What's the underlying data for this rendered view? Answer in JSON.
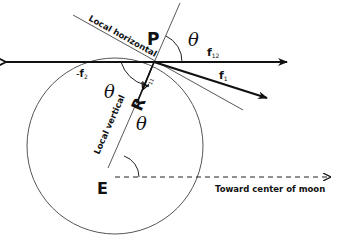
{
  "diagram": {
    "points": {
      "P": "P",
      "E": "E",
      "R": "R"
    },
    "angle_symbol": "θ",
    "lines": {
      "local_horizontal": "Local horizontal",
      "local_vertical": "Local vertical",
      "toward_moon": "Toward center of moon"
    },
    "forces": {
      "f12_base": "f",
      "f12_sub": "12",
      "f1_base": "f",
      "f1_sub": "1",
      "f11_base": "f",
      "f11_sub": "11",
      "neg_f2_prefix": "-",
      "neg_f2_base": "f",
      "neg_f2_sub": "2"
    },
    "colors": {
      "stroke": "#111111",
      "circle": "#555555",
      "background": "#ffffff"
    }
  }
}
